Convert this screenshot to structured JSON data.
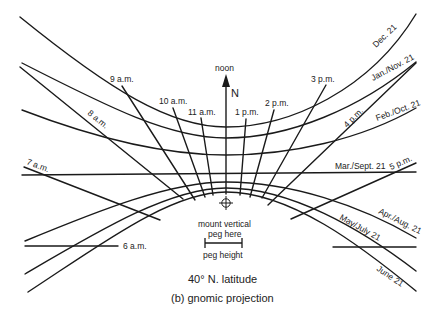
{
  "diagram": {
    "title": "40° N. latitude",
    "subtitle": "(b) gnomic projection",
    "noon_label": "noon",
    "north_label": "N",
    "peg_instruction_line1": "mount vertical",
    "peg_instruction_line2": "peg here",
    "peg_scale_label": "peg height",
    "date_lines": [
      {
        "label": "Dec. 21"
      },
      {
        "label": "Jan./Nov. 21"
      },
      {
        "label": "Feb./Oct. 21"
      },
      {
        "label": "Mar./Sept. 21"
      },
      {
        "label": "Apr./Aug. 21"
      },
      {
        "label": "May/July 21"
      },
      {
        "label": "June 21"
      }
    ],
    "hour_lines": [
      {
        "label": "6 a.m."
      },
      {
        "label": "7 a.m."
      },
      {
        "label": "8 a.m."
      },
      {
        "label": "9 a.m."
      },
      {
        "label": "10 a.m."
      },
      {
        "label": "11 a.m."
      },
      {
        "label": "1 p.m."
      },
      {
        "label": "2 p.m."
      },
      {
        "label": "3 p.m."
      },
      {
        "label": "4 p.m."
      },
      {
        "label": "5 p.m."
      }
    ]
  }
}
